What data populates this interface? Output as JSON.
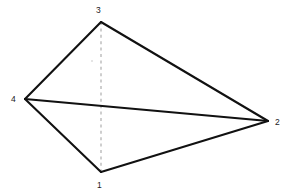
{
  "figure": {
    "background_color": "#ffffff",
    "width": 291,
    "height": 196,
    "solid_edge_color": "#111111",
    "dashed_edge_color": "#b4b4b4",
    "label_color": "#1a1a1a"
  },
  "vertices": [
    {
      "id": "1",
      "label": "1",
      "x": 101,
      "y": 172,
      "label_x": 97,
      "label_y": 181
    },
    {
      "id": "2",
      "label": "2",
      "x": 268,
      "y": 121,
      "label_x": 275,
      "label_y": 118
    },
    {
      "id": "3",
      "label": "3",
      "x": 101,
      "y": 22,
      "label_x": 96,
      "label_y": 6
    },
    {
      "id": "4",
      "label": "4",
      "x": 25,
      "y": 99,
      "label_x": 11,
      "label_y": 95
    }
  ],
  "edges": [
    {
      "from": "4",
      "to": "3",
      "style": "solid",
      "name": "edge-4-3"
    },
    {
      "from": "3",
      "to": "2",
      "style": "solid",
      "name": "edge-3-2"
    },
    {
      "from": "4",
      "to": "2",
      "style": "solid",
      "name": "edge-4-2"
    },
    {
      "from": "4",
      "to": "1",
      "style": "solid",
      "name": "edge-4-1"
    },
    {
      "from": "1",
      "to": "2",
      "style": "solid",
      "name": "edge-1-2"
    },
    {
      "from": "3",
      "to": "1",
      "style": "dashed",
      "name": "edge-3-1"
    }
  ],
  "chart_data": {
    "type": "scatter",
    "title": "",
    "xlabel": "",
    "ylabel": "",
    "grid": false,
    "legend": "none",
    "nodes": [
      {
        "label": "1",
        "x": 101,
        "y": 172
      },
      {
        "label": "2",
        "x": 268,
        "y": 121
      },
      {
        "label": "3",
        "x": 101,
        "y": 22
      },
      {
        "label": "4",
        "x": 25,
        "y": 99
      }
    ],
    "links": [
      {
        "source": "4",
        "target": "3",
        "style": "solid"
      },
      {
        "source": "3",
        "target": "2",
        "style": "solid"
      },
      {
        "source": "4",
        "target": "2",
        "style": "solid"
      },
      {
        "source": "4",
        "target": "1",
        "style": "solid"
      },
      {
        "source": "1",
        "target": "2",
        "style": "solid"
      },
      {
        "source": "3",
        "target": "1",
        "style": "dashed"
      }
    ]
  }
}
